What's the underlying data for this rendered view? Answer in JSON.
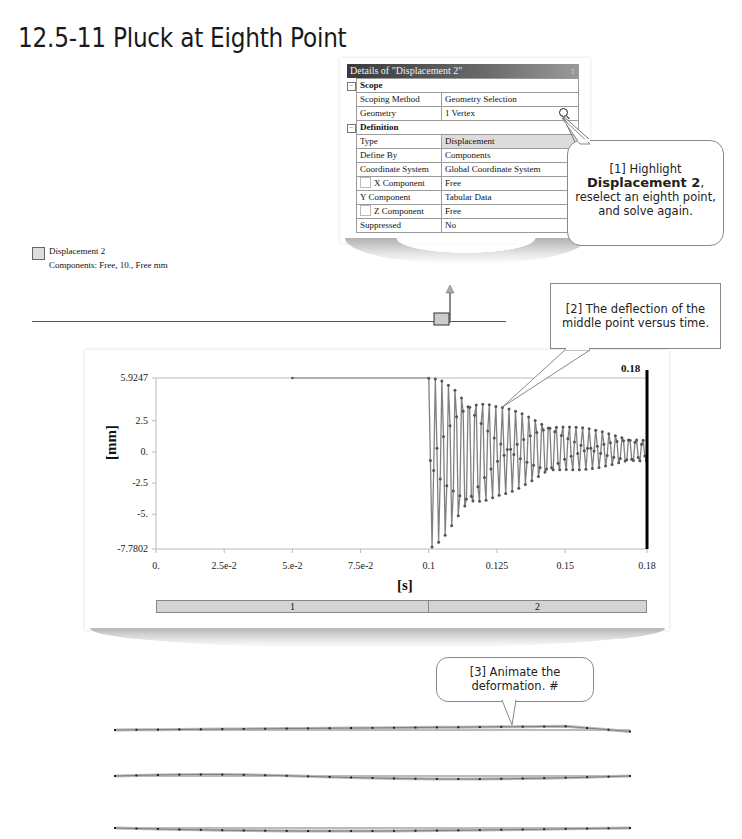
{
  "page": {
    "title": "12.5-11 Pluck at Eighth Point"
  },
  "details_panel": {
    "title": "Details of \"Displacement 2\"",
    "pin_icon": "pin-icon",
    "categories": [
      {
        "name": "Scope",
        "rows": [
          {
            "label": "Scoping Method",
            "value": "Geometry Selection"
          },
          {
            "label": "Geometry",
            "value": "1 Vertex"
          }
        ]
      },
      {
        "name": "Definition",
        "rows": [
          {
            "label": "Type",
            "value": "Displacement"
          },
          {
            "label": "Define By",
            "value": "Components"
          },
          {
            "label": "Coordinate System",
            "value": "Global Coordinate System"
          },
          {
            "label": "X Component",
            "value": "Free"
          },
          {
            "label": "Y Component",
            "value": "Tabular Data"
          },
          {
            "label": "Z Component",
            "value": "Free"
          },
          {
            "label": "Suppressed",
            "value": "No"
          }
        ]
      }
    ]
  },
  "callouts": {
    "c1": {
      "prefix": "[1] Highlight",
      "bold": "Displacement 2",
      "suffix": ",",
      "line3": "reselect an eighth point,",
      "line4": "and solve again."
    },
    "c2": {
      "line1": "[2] The deflection of the",
      "line2": "middle point versus time."
    },
    "c3": {
      "line1": "[3] Animate the",
      "line2": "deformation. #"
    }
  },
  "legend": {
    "name": "Displacement 2",
    "detail": "Components: Free, 10., Free mm",
    "swatch_color": "#dddddd"
  },
  "chart_data": {
    "type": "line",
    "title": "",
    "xlabel": "[s]",
    "ylabel": "[mm]",
    "ylim": [
      -7.7802,
      5.9247
    ],
    "xlim": [
      0,
      0.18
    ],
    "y_ticks": [
      "5.9247",
      "2.5",
      "0.",
      "-2.5",
      "-5.",
      "-7.7802"
    ],
    "x_ticks": [
      "0.",
      "2.5e-2",
      "5.e-2",
      "7.5e-2",
      "0.1",
      "0.125",
      "0.15",
      "0.18"
    ],
    "current_time_marker": "0.18",
    "series": [
      {
        "name": "Displacement 2 deflection (middle point)",
        "description": "Constant 5.9247 mm hold from t=0.05 to t=0.1 s, then damped oscillation between about +5.9 and -7.8 mm decaying to about +/-1 mm by t=0.18 s",
        "x": [
          0.05,
          0.1,
          0.1,
          0.105,
          0.11,
          0.125,
          0.15,
          0.18
        ],
        "envelope_upper": [
          5.9247,
          5.9247,
          5.9,
          5.9,
          5.7,
          3.7,
          2.2,
          1.0
        ],
        "envelope_lower": [
          5.9247,
          5.9247,
          -7.78,
          -7.2,
          -6.2,
          -3.6,
          -1.6,
          -0.8
        ]
      }
    ],
    "step_bar": [
      {
        "label": "1",
        "start": 0,
        "end": 0.1
      },
      {
        "label": "2",
        "start": 0.1,
        "end": 0.18
      }
    ],
    "grid": false,
    "legend_position": "none"
  },
  "colors": {
    "panel_title_bg": "#4a4a4a",
    "curve": "#808080",
    "marker": "#555555",
    "time_marker": "#000000",
    "step_bar": "#d4d4d4"
  }
}
